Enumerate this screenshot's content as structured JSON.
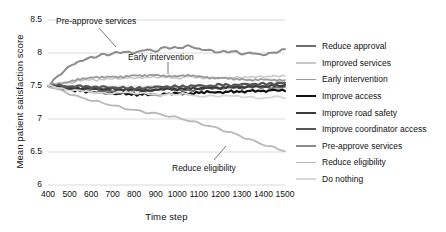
{
  "chart_data": {
    "type": "line",
    "title": "",
    "xlabel": "Time step",
    "ylabel": "Mean patient satisfaction score",
    "xlim": [
      400,
      1500
    ],
    "ylim": [
      6,
      8.5
    ],
    "xticks": [
      400,
      500,
      600,
      700,
      800,
      900,
      1000,
      1100,
      1200,
      1300,
      1400,
      1500
    ],
    "yticks": [
      "6",
      "6.5",
      "7",
      "7.5",
      "8",
      "8.5"
    ],
    "grid": "horizontal",
    "legend_position": "right",
    "x": [
      400,
      450,
      500,
      550,
      600,
      650,
      700,
      750,
      800,
      850,
      900,
      950,
      1000,
      1050,
      1100,
      1150,
      1200,
      1250,
      1300,
      1350,
      1400,
      1450,
      1500
    ],
    "series": [
      {
        "name": "Reduce approval",
        "color": "#6e6e6e",
        "width": 2.0,
        "values": [
          7.5,
          7.47,
          7.45,
          7.44,
          7.46,
          7.43,
          7.42,
          7.45,
          7.44,
          7.42,
          7.44,
          7.46,
          7.44,
          7.43,
          7.45,
          7.47,
          7.46,
          7.48,
          7.47,
          7.49,
          7.48,
          7.47,
          7.49
        ]
      },
      {
        "name": "Improved services",
        "color": "#c9c9c9",
        "width": 1.6,
        "values": [
          7.5,
          7.52,
          7.55,
          7.58,
          7.6,
          7.59,
          7.62,
          7.61,
          7.63,
          7.62,
          7.64,
          7.63,
          7.62,
          7.64,
          7.63,
          7.61,
          7.63,
          7.62,
          7.64,
          7.63,
          7.65,
          7.64,
          7.66
        ]
      },
      {
        "name": "Early intervention",
        "color": "#9a9a9a",
        "width": 1.8,
        "values": [
          7.5,
          7.53,
          7.57,
          7.61,
          7.63,
          7.62,
          7.65,
          7.64,
          7.66,
          7.65,
          7.67,
          7.66,
          7.64,
          7.66,
          7.65,
          7.63,
          7.62,
          7.6,
          7.61,
          7.59,
          7.6,
          7.58,
          7.59
        ]
      },
      {
        "name": "Improve access",
        "color": "#111111",
        "width": 2.2,
        "values": [
          7.5,
          7.48,
          7.45,
          7.43,
          7.41,
          7.4,
          7.38,
          7.39,
          7.37,
          7.38,
          7.36,
          7.38,
          7.39,
          7.38,
          7.4,
          7.41,
          7.4,
          7.42,
          7.41,
          7.43,
          7.42,
          7.44,
          7.43
        ]
      },
      {
        "name": "Improve road safety",
        "color": "#3a3a3a",
        "width": 2.2,
        "values": [
          7.5,
          7.49,
          7.47,
          7.46,
          7.47,
          7.45,
          7.46,
          7.44,
          7.45,
          7.43,
          7.44,
          7.46,
          7.45,
          7.47,
          7.46,
          7.48,
          7.47,
          7.49,
          7.48,
          7.5,
          7.49,
          7.51,
          7.5
        ]
      },
      {
        "name": "Improve coordinator access",
        "color": "#555555",
        "width": 2.2,
        "values": [
          7.5,
          7.51,
          7.49,
          7.5,
          7.48,
          7.49,
          7.47,
          7.48,
          7.46,
          7.47,
          7.49,
          7.48,
          7.5,
          7.49,
          7.51,
          7.5,
          7.52,
          7.51,
          7.53,
          7.52,
          7.54,
          7.53,
          7.55
        ]
      },
      {
        "name": "Pre-approve services",
        "color": "#8c8c8c",
        "width": 2.0,
        "values": [
          7.5,
          7.66,
          7.8,
          7.88,
          7.93,
          7.97,
          7.99,
          8.02,
          8.0,
          8.05,
          8.03,
          8.09,
          8.07,
          8.11,
          8.06,
          8.04,
          8.01,
          8.03,
          7.99,
          8.0,
          7.97,
          8.01,
          8.05
        ]
      },
      {
        "name": "Reduce eligibility",
        "color": "#b8b8b8",
        "width": 1.8,
        "values": [
          7.5,
          7.44,
          7.38,
          7.32,
          7.28,
          7.24,
          7.2,
          7.16,
          7.13,
          7.1,
          7.08,
          7.05,
          7.02,
          6.98,
          6.94,
          6.9,
          6.85,
          6.8,
          6.74,
          6.68,
          6.62,
          6.57,
          6.52
        ]
      },
      {
        "name": "Do nothing",
        "color": "#d6d6d6",
        "width": 1.8,
        "values": [
          7.52,
          7.48,
          7.44,
          7.42,
          7.4,
          7.41,
          7.39,
          7.4,
          7.38,
          7.39,
          7.37,
          7.38,
          7.36,
          7.37,
          7.35,
          7.36,
          7.34,
          7.35,
          7.33,
          7.34,
          7.32,
          7.33,
          7.31
        ]
      }
    ],
    "annotations": [
      {
        "text": "Pre-approve services",
        "x": 56,
        "y": 16
      },
      {
        "text": "Early intervention",
        "x": 128,
        "y": 52
      },
      {
        "text": "Reduce eligibility",
        "x": 172,
        "y": 163
      }
    ]
  }
}
